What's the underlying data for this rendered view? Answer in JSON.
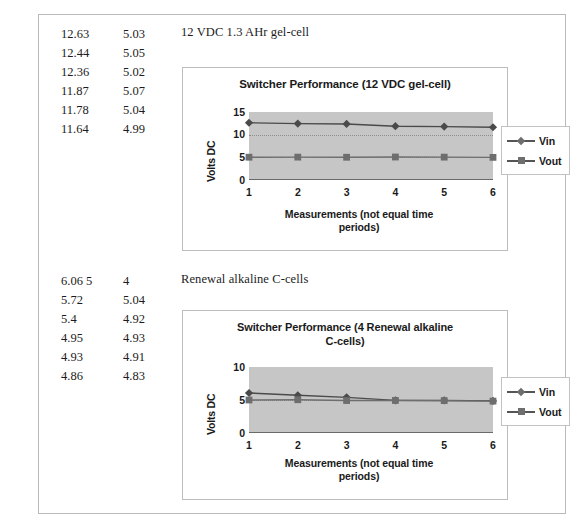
{
  "document": {
    "ghost_top_line": "· · ·"
  },
  "sections": [
    {
      "caption": "12 VDC 1.3 AHr gel-cell",
      "table": {
        "rows": [
          {
            "vin": "12.63",
            "vout": "5.03"
          },
          {
            "vin": "12.44",
            "vout": "5.05"
          },
          {
            "vin": "12.36",
            "vout": "5.02"
          },
          {
            "vin": "11.87",
            "vout": "5.07"
          },
          {
            "vin": "11.78",
            "vout": "5.04"
          },
          {
            "vin": "11.64",
            "vout": "4.99"
          }
        ]
      }
    },
    {
      "caption": "Renewal alkaline C-cells",
      "table": {
        "rows": [
          {
            "vin": "6.06 5",
            "vout": "4"
          },
          {
            "vin": "5.72",
            "vout": "5.04"
          },
          {
            "vin": "5.4",
            "vout": "4.92"
          },
          {
            "vin": "4.95",
            "vout": "4.93"
          },
          {
            "vin": "4.93",
            "vout": "4.91"
          },
          {
            "vin": "4.86",
            "vout": "4.83"
          }
        ]
      }
    }
  ],
  "chart_data": [
    {
      "type": "line",
      "title": "Switcher Performance (12 VDC gel-cell)",
      "xlabel": "Measurements (not equal time periods)",
      "ylabel": "Volts DC",
      "categories": [
        "1",
        "2",
        "3",
        "4",
        "5",
        "6"
      ],
      "x": [
        1,
        2,
        3,
        4,
        5,
        6
      ],
      "ylim": [
        0,
        15
      ],
      "yticks": [
        0,
        5,
        10,
        15
      ],
      "ytick_labels": [
        "0",
        "5",
        "10",
        "15"
      ],
      "grid": true,
      "legend_position": "right",
      "plot_background": "#c6c6c6",
      "series": [
        {
          "name": "Vin",
          "marker": "diamond",
          "color": "#4a4a4a",
          "values": [
            12.63,
            12.44,
            12.36,
            11.87,
            11.78,
            11.64
          ]
        },
        {
          "name": "Vout",
          "marker": "square",
          "color": "#6e6e6e",
          "values": [
            5.03,
            5.05,
            5.02,
            5.07,
            5.04,
            4.99
          ]
        }
      ]
    },
    {
      "type": "line",
      "title": "Switcher Performance (4 Renewal alkaline C-cells)",
      "xlabel": "Measurements (not equal time periods)",
      "ylabel": "Volts DC",
      "categories": [
        "1",
        "2",
        "3",
        "4",
        "5",
        "6"
      ],
      "x": [
        1,
        2,
        3,
        4,
        5,
        6
      ],
      "ylim": [
        0,
        10
      ],
      "yticks": [
        0,
        5,
        10
      ],
      "ytick_labels": [
        "0",
        "5",
        "10"
      ],
      "grid": true,
      "legend_position": "right",
      "plot_background": "#c6c6c6",
      "series": [
        {
          "name": "Vin",
          "marker": "diamond",
          "color": "#4a4a4a",
          "values": [
            6.06,
            5.72,
            5.4,
            4.95,
            4.93,
            4.86
          ]
        },
        {
          "name": "Vout",
          "marker": "square",
          "color": "#6e6e6e",
          "values": [
            5.0,
            5.04,
            4.92,
            4.93,
            4.91,
            4.83
          ]
        }
      ]
    }
  ],
  "chart_titles": {
    "chart1_line1": "Switcher Performance (12 VDC gel-cell)",
    "chart2_line1": "Switcher Performance (4 Renewal alkaline",
    "chart2_line2": "C-cells)"
  },
  "axis_text": {
    "y_title": "Volts DC",
    "x_title_line1": "Measurements (not equal time",
    "x_title_line2": "periods)"
  }
}
